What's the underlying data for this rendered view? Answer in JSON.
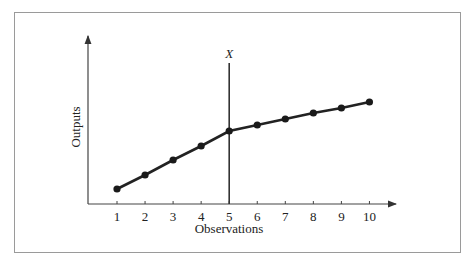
{
  "chart_data": {
    "type": "line",
    "title": "",
    "xlabel": "Observations",
    "ylabel": "Outputs",
    "categories": [
      "1",
      "2",
      "3",
      "4",
      "5",
      "6",
      "7",
      "8",
      "9",
      "10"
    ],
    "x": [
      1,
      2,
      3,
      4,
      5,
      6,
      7,
      8,
      9,
      10
    ],
    "series": [
      {
        "name": "Outputs",
        "values": [
          15,
          29,
          44,
          58,
          73,
          79,
          85,
          91,
          96,
          102
        ]
      }
    ],
    "y_ticks_shown": false,
    "grid": false,
    "legend": null,
    "annotations": [
      {
        "type": "vertical-line",
        "x": 5,
        "label": "X"
      }
    ],
    "note": "Y values are relative (no y-axis tick labels shown); slope steeper before X=5, flatter after"
  },
  "axes": {
    "x_title": "Observations",
    "y_title": "Outputs",
    "x_tick_labels": [
      "1",
      "2",
      "3",
      "4",
      "5",
      "6",
      "7",
      "8",
      "9",
      "10"
    ]
  },
  "annotation": {
    "label": "X"
  }
}
